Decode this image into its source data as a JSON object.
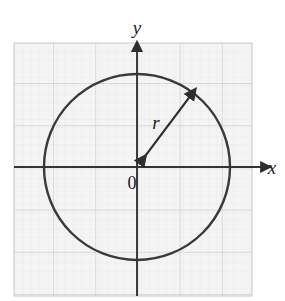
{
  "figure": {
    "title": "",
    "kind": "coordinate-plane-circle-diagram",
    "background_color": "#ffffff",
    "plot_area": {
      "fill_color": "#f4f4f4",
      "border_color": "#c9c9c9",
      "left": 14,
      "top": 43,
      "right": 252,
      "bottom": 296
    },
    "grid": {
      "major_color": "#c0c0c0",
      "minor_color": "#e6e6e6",
      "major_spacing": 42.2,
      "minor_spacing": 8.44,
      "major_columns": 6,
      "major_rows": 6,
      "show_minor": true
    },
    "axes": {
      "color": "#333333",
      "stroke_width": 2,
      "origin_x": 137,
      "origin_y": 167,
      "x_axis": {
        "label": "x",
        "from_x": 14,
        "to_x": 268,
        "arrow": "right"
      },
      "y_axis": {
        "label": "y",
        "from_y": 296,
        "to_y": 45,
        "arrow": "up"
      }
    },
    "origin_label": "0",
    "circle": {
      "center_x": 137,
      "center_y": 167,
      "radius": 93,
      "stroke_color": "#3a3a3a",
      "stroke_width": 2.4,
      "fill": "none"
    },
    "radius_arrow": {
      "label": "r",
      "from_x": 137,
      "from_y": 167,
      "to_x": 194,
      "to_y": 91,
      "double_headed": true,
      "stroke_color": "#2e2e2e",
      "stroke_width": 2.2,
      "label_x": 159,
      "label_y": 121
    }
  },
  "chart_data": {
    "type": "scatter",
    "title": "",
    "xlabel": "x",
    "ylabel": "y",
    "annotations": [
      "r",
      "0"
    ],
    "grid": true,
    "legend": "none",
    "xlim": [
      -2.9,
      3.1
    ],
    "ylim": [
      -3.1,
      3.0
    ],
    "shapes": [
      {
        "shape": "circle",
        "center": [
          0,
          0
        ],
        "radius": 2.2,
        "label": "circle of radius r centered at origin"
      },
      {
        "shape": "arrow",
        "from": [
          0,
          0
        ],
        "to": [
          1.35,
          1.8
        ],
        "label": "r",
        "double_headed": true
      }
    ]
  }
}
